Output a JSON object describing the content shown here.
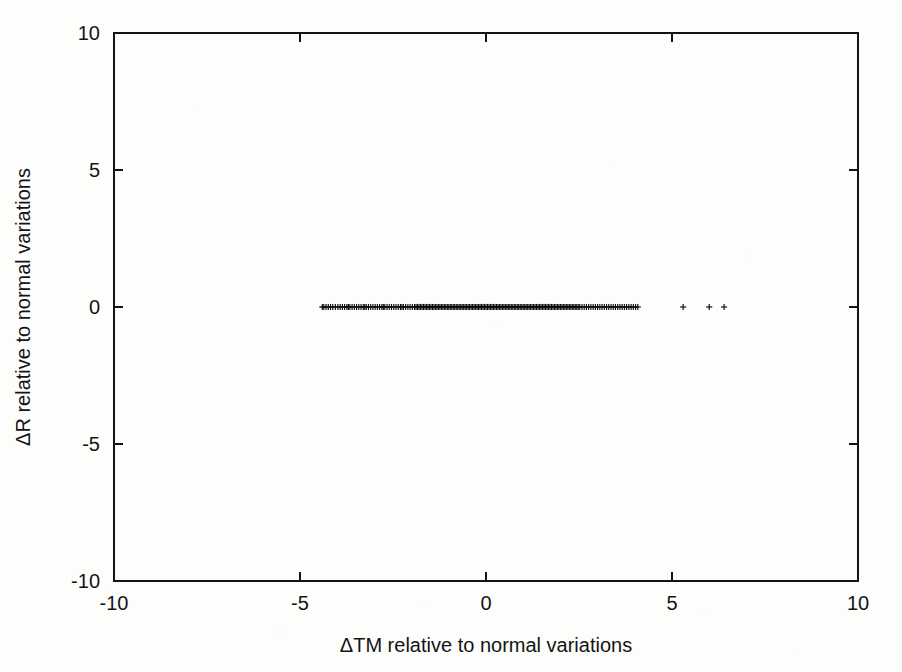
{
  "figure": {
    "kind": "scatter-plot",
    "background_color": "#fdfdfc",
    "ink_color": "#141414"
  },
  "chart_data": {
    "type": "scatter",
    "title": "",
    "subtitle": "",
    "xlabel": "ΔTM relative to normal variations",
    "ylabel": "ΔR relative to normal variations",
    "xlim": [
      -10,
      10
    ],
    "ylim": [
      -10,
      10
    ],
    "xticks": [
      -10,
      -5,
      0,
      5,
      10
    ],
    "yticks": [
      -10,
      -5,
      0,
      5,
      10
    ],
    "xtick_labels": [
      "-10",
      "-5",
      "0",
      "5",
      "10"
    ],
    "ytick_labels": [
      "-10",
      "-5",
      "0",
      "5",
      "10"
    ],
    "grid": false,
    "legend": null,
    "legend_position": "none",
    "tick_direction": "in",
    "frame": "full-box",
    "marker": "plus",
    "marker_color": "#0b0b0b",
    "series": [
      {
        "name": "observations",
        "marker": "plus",
        "note": "all points lie on the horizontal line y = 0; x values form a dense band from about -4.4 to +4.1 with three isolated outliers near 5.3, 6.0 and 6.4",
        "y_constant": 0,
        "x": [
          -4.4,
          -4.36,
          -4.3,
          -4.24,
          -4.18,
          -4.12,
          -4.05,
          -3.98,
          -3.92,
          -3.86,
          -3.8,
          -3.74,
          -3.7,
          -3.66,
          -3.6,
          -3.54,
          -3.48,
          -3.42,
          -3.36,
          -3.3,
          -3.26,
          -3.22,
          -3.16,
          -3.1,
          -3.04,
          -2.98,
          -2.92,
          -2.86,
          -2.8,
          -2.76,
          -2.72,
          -2.66,
          -2.6,
          -2.54,
          -2.48,
          -2.42,
          -2.36,
          -2.3,
          -2.26,
          -2.22,
          -2.16,
          -2.1,
          -2.04,
          -1.98,
          -1.92,
          -1.88,
          -1.84,
          -1.8,
          -1.76,
          -1.72,
          -1.68,
          -1.64,
          -1.6,
          -1.56,
          -1.52,
          -1.48,
          -1.44,
          -1.4,
          -1.36,
          -1.32,
          -1.28,
          -1.24,
          -1.2,
          -1.16,
          -1.12,
          -1.08,
          -1.04,
          -1.0,
          -0.96,
          -0.92,
          -0.88,
          -0.84,
          -0.8,
          -0.76,
          -0.72,
          -0.68,
          -0.64,
          -0.6,
          -0.56,
          -0.52,
          -0.48,
          -0.44,
          -0.4,
          -0.36,
          -0.32,
          -0.28,
          -0.24,
          -0.2,
          -0.16,
          -0.12,
          -0.08,
          -0.04,
          0.0,
          0.04,
          0.08,
          0.12,
          0.16,
          0.2,
          0.24,
          0.28,
          0.32,
          0.36,
          0.4,
          0.44,
          0.48,
          0.52,
          0.56,
          0.6,
          0.64,
          0.68,
          0.72,
          0.76,
          0.8,
          0.84,
          0.88,
          0.92,
          0.96,
          1.0,
          1.04,
          1.08,
          1.12,
          1.16,
          1.2,
          1.24,
          1.28,
          1.32,
          1.36,
          1.4,
          1.44,
          1.48,
          1.52,
          1.56,
          1.6,
          1.64,
          1.68,
          1.72,
          1.76,
          1.8,
          1.84,
          1.88,
          1.92,
          1.96,
          2.0,
          2.04,
          2.08,
          2.12,
          2.16,
          2.2,
          2.24,
          2.28,
          2.32,
          2.36,
          2.4,
          2.44,
          2.48,
          2.52,
          2.58,
          2.64,
          2.7,
          2.76,
          2.82,
          2.88,
          2.94,
          3.0,
          3.06,
          3.12,
          3.18,
          3.24,
          3.3,
          3.36,
          3.42,
          3.48,
          3.54,
          3.6,
          3.66,
          3.72,
          3.78,
          3.84,
          3.9,
          3.96,
          4.02,
          4.08,
          5.3,
          6.0,
          6.4
        ]
      }
    ],
    "dense_band": {
      "x_min": -4.4,
      "x_max": 4.1,
      "y": 0
    },
    "outliers": [
      {
        "x": 5.3,
        "y": 0
      },
      {
        "x": 6.0,
        "y": 0
      },
      {
        "x": 6.4,
        "y": 0
      }
    ]
  }
}
